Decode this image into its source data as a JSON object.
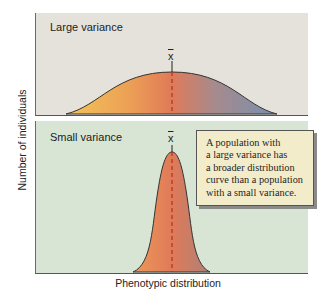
{
  "figure": {
    "y_axis_label": "Number of individuals",
    "x_axis_label": "Phenotypic distribution",
    "panels": [
      {
        "label": "Large variance",
        "mean_symbol": "x",
        "background": "#e5e2db"
      },
      {
        "label": "Small variance",
        "mean_symbol": "x",
        "background": "#d8e5d5"
      }
    ],
    "callout": {
      "lines": [
        "A population with",
        "a large variance has",
        "a broader distribution",
        "curve than a population",
        "with a small variance."
      ]
    },
    "colors": {
      "curve_left": "#f0b850",
      "curve_center": "#e07a58",
      "curve_right_large": "#7a8cab",
      "curve_right_small": "#b87e74",
      "mean_line": "#b03020",
      "callout_bg": "#f3ecca"
    }
  }
}
